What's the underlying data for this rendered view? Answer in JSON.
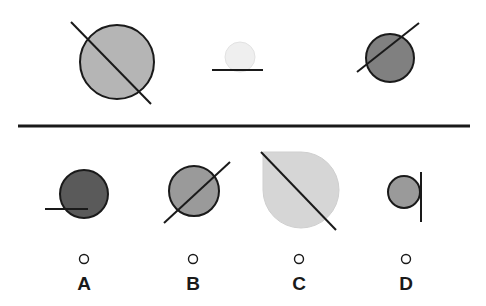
{
  "puzzle": {
    "type": "visual-analogy-multiple-choice",
    "colors": {
      "background": "#ffffff",
      "stroke": "#1a1a1a",
      "divider": "#1a1a1a",
      "label_text": "#1a1a1a",
      "fill_light": "#d6d6d6",
      "fill_very_light": "#efefef",
      "fill_medium_light": "#b5b5b5",
      "fill_medium": "#9a9a9a",
      "fill_medium_dark": "#808080",
      "fill_dark": "#5a5a5a"
    },
    "stimulus_row": {
      "name": "stimulus-row",
      "count": 3,
      "items": [
        {
          "id": "stimulus-1",
          "shape": "circle",
          "cx": 117,
          "cy": 62,
          "r": 37,
          "fill": "#b5b5b5",
          "stroke": "#1a1a1a",
          "stroke_width": 2,
          "line": {
            "name": "diagonal-line-down-right",
            "x1": 71,
            "y1": 22,
            "x2": 151,
            "y2": 104,
            "stroke_width": 2
          }
        },
        {
          "id": "stimulus-2",
          "shape": "circle",
          "cx": 240,
          "cy": 57,
          "r": 15,
          "fill": "#efefef",
          "stroke": "#e2e2e2",
          "stroke_width": 1,
          "line": {
            "name": "horizontal-line",
            "x1": 212,
            "y1": 70,
            "x2": 263,
            "y2": 70,
            "stroke_width": 2
          }
        },
        {
          "id": "stimulus-3",
          "shape": "circle",
          "cx": 390,
          "cy": 58,
          "r": 24,
          "fill": "#808080",
          "stroke": "#1a1a1a",
          "stroke_width": 2,
          "line": {
            "name": "diagonal-line-up-right",
            "x1": 357,
            "y1": 72,
            "x2": 419,
            "y2": 23,
            "stroke_width": 2
          }
        }
      ]
    },
    "divider": {
      "name": "horizontal-divider",
      "x1": 18,
      "y1": 126,
      "x2": 470,
      "y2": 126,
      "stroke_width": 3
    },
    "options_row": {
      "name": "answer-options-row",
      "count": 4,
      "selected": null,
      "items": [
        {
          "id": "option-a",
          "label": "A",
          "label_x": 84,
          "label_y": 290,
          "radio": {
            "cx": 84,
            "cy": 259,
            "r": 4.5
          },
          "shape": "circle",
          "cx": 84,
          "cy": 194,
          "r": 24,
          "fill": "#5a5a5a",
          "stroke": "#1a1a1a",
          "stroke_width": 2,
          "line": {
            "name": "horizontal-line",
            "x1": 45,
            "y1": 209,
            "x2": 88,
            "y2": 209,
            "stroke_width": 2
          }
        },
        {
          "id": "option-b",
          "label": "B",
          "label_x": 193,
          "label_y": 290,
          "radio": {
            "cx": 193,
            "cy": 259,
            "r": 4.5
          },
          "shape": "circle",
          "cx": 194,
          "cy": 191,
          "r": 25,
          "fill": "#9a9a9a",
          "stroke": "#1a1a1a",
          "stroke_width": 2,
          "line": {
            "name": "diagonal-line-up-right",
            "x1": 164,
            "y1": 223,
            "x2": 230,
            "y2": 162,
            "stroke_width": 2
          }
        },
        {
          "id": "option-c",
          "label": "C",
          "label_x": 299,
          "label_y": 290,
          "radio": {
            "cx": 299,
            "cy": 259,
            "r": 4.5
          },
          "shape": "teardrop-square-top-left",
          "cx": 301,
          "cy": 190,
          "r": 38,
          "fill": "#d6d6d6",
          "stroke": "#cfcfcf",
          "stroke_width": 1,
          "line": {
            "name": "diagonal-line-down-right",
            "x1": 261,
            "y1": 152,
            "x2": 336,
            "y2": 230,
            "stroke_width": 2
          }
        },
        {
          "id": "option-d",
          "label": "D",
          "label_x": 406,
          "label_y": 290,
          "radio": {
            "cx": 406,
            "cy": 259,
            "r": 4.5
          },
          "shape": "circle",
          "cx": 404,
          "cy": 192,
          "r": 16,
          "fill": "#9a9a9a",
          "stroke": "#1a1a1a",
          "stroke_width": 2,
          "line": {
            "name": "vertical-line",
            "x1": 421,
            "y1": 172,
            "x2": 421,
            "y2": 222,
            "stroke_width": 2
          }
        }
      ]
    }
  }
}
